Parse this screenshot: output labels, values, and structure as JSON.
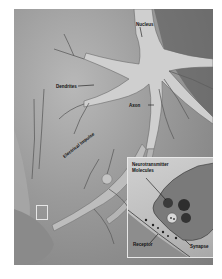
{
  "diagram": {
    "labels": {
      "nucleus": "Nucleus",
      "dendrites": "Dendrites",
      "axon": "Axon",
      "electrical_impulse": "Electrical Impulse",
      "neurotransmitter_line1": "Neurotransmitter",
      "neurotransmitter_line2": "Molecules",
      "receptor": "Receptor",
      "synapse": "Synapse"
    },
    "colors": {
      "background": "#ffffff",
      "image_tone": "#9a9a9a",
      "neuron_body": "#c9c9c9",
      "label_text": "#111111",
      "inset_border": "#e8e8e8"
    }
  }
}
